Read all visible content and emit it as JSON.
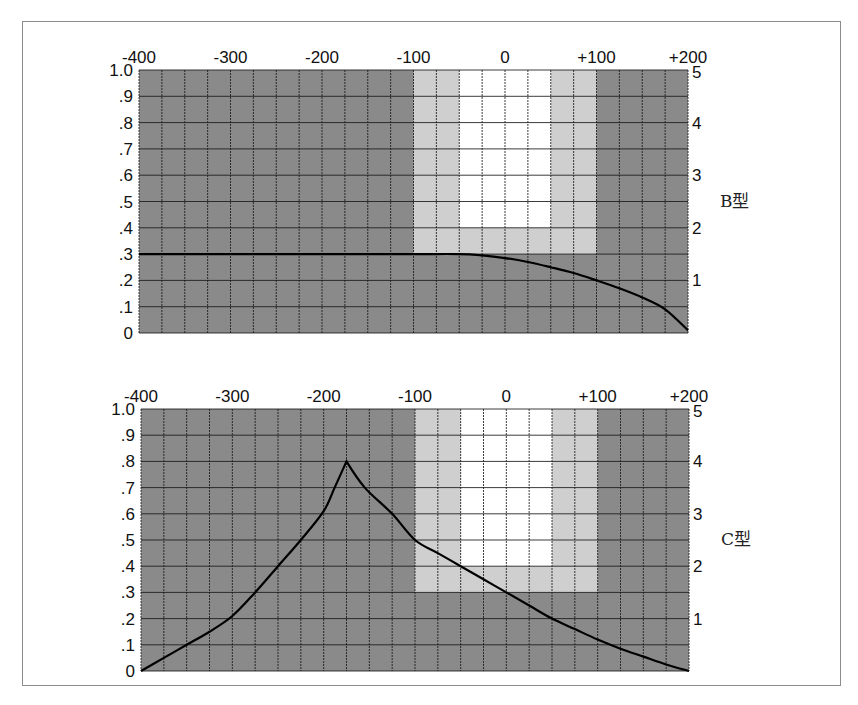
{
  "chart_data": [
    {
      "type": "line",
      "label": "B型",
      "x_ticks": [
        "-400",
        "-300",
        "-200",
        "-100",
        "0",
        "+100",
        "+200"
      ],
      "x_tick_values": [
        -400,
        -300,
        -200,
        -100,
        0,
        100,
        200
      ],
      "xlim": [
        -400,
        200
      ],
      "left_y_ticks": [
        "1.0",
        ".9",
        ".8",
        ".7",
        ".6",
        ".5",
        ".4",
        ".3",
        ".2",
        ".1",
        "0"
      ],
      "right_y_ticks": [
        "5",
        "4",
        "3",
        "2",
        "1"
      ],
      "ylim": [
        0,
        1.0
      ],
      "grid": {
        "x_step": 25,
        "y_step": 0.1
      },
      "zones": [
        {
          "name": "light",
          "x0": -100,
          "x1": 100,
          "y0": 0.3,
          "y1": 1.0,
          "color": "#cfcfcf"
        },
        {
          "name": "white",
          "x0": -50,
          "x1": 50,
          "y0": 0.4,
          "y1": 1.0,
          "color": "#ffffff"
        }
      ],
      "series": [
        {
          "name": "B型",
          "x": [
            -400,
            -300,
            -200,
            -100,
            -50,
            -25,
            0,
            25,
            50,
            75,
            100,
            125,
            150,
            175,
            200
          ],
          "y": [
            0.3,
            0.3,
            0.3,
            0.3,
            0.3,
            0.295,
            0.285,
            0.27,
            0.25,
            0.228,
            0.2,
            0.17,
            0.135,
            0.09,
            0.01
          ]
        }
      ]
    },
    {
      "type": "line",
      "label": "C型",
      "x_ticks": [
        "-400",
        "-300",
        "-200",
        "-100",
        "0",
        "+100",
        "+200"
      ],
      "x_tick_values": [
        -400,
        -300,
        -200,
        -100,
        0,
        100,
        200
      ],
      "xlim": [
        -400,
        200
      ],
      "left_y_ticks": [
        "1.0",
        ".9",
        ".8",
        ".7",
        ".6",
        ".5",
        ".4",
        ".3",
        ".2",
        ".1",
        "0"
      ],
      "right_y_ticks": [
        "5",
        "4",
        "3",
        "2",
        "1"
      ],
      "ylim": [
        0,
        1.0
      ],
      "grid": {
        "x_step": 25,
        "y_step": 0.1
      },
      "zones": [
        {
          "name": "light",
          "x0": -100,
          "x1": 100,
          "y0": 0.3,
          "y1": 1.0,
          "color": "#cfcfcf"
        },
        {
          "name": "white",
          "x0": -50,
          "x1": 50,
          "y0": 0.4,
          "y1": 1.0,
          "color": "#ffffff"
        }
      ],
      "series": [
        {
          "name": "C型",
          "x": [
            -400,
            -375,
            -350,
            -325,
            -300,
            -275,
            -250,
            -225,
            -200,
            -188,
            -175,
            -155,
            -125,
            -100,
            -75,
            -50,
            -25,
            0,
            25,
            50,
            75,
            100,
            125,
            150,
            175,
            200
          ],
          "y": [
            0.0,
            0.05,
            0.1,
            0.15,
            0.21,
            0.3,
            0.4,
            0.5,
            0.61,
            0.7,
            0.8,
            0.7,
            0.6,
            0.5,
            0.45,
            0.4,
            0.35,
            0.3,
            0.25,
            0.2,
            0.16,
            0.12,
            0.085,
            0.055,
            0.025,
            0.0
          ]
        }
      ]
    }
  ],
  "colors": {
    "dark_zone": "#8a8a8a",
    "light_zone": "#cfcfcf",
    "white_zone": "#ffffff",
    "grid_line": "#1a1a1a",
    "curve": "#000000"
  }
}
